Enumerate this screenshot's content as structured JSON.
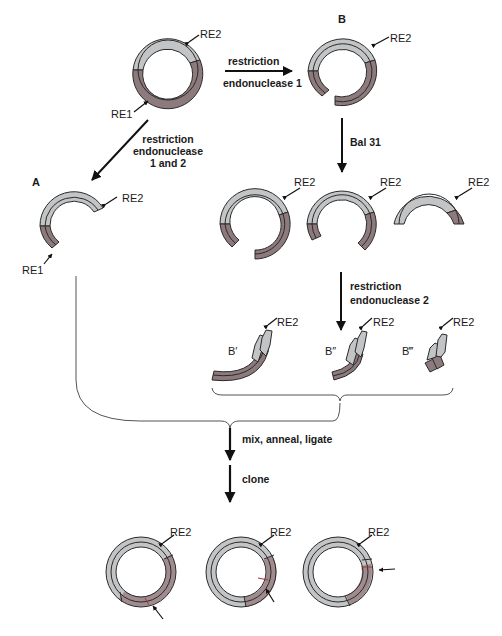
{
  "figure": {
    "colors": {
      "light_strand": "#c2c4c6",
      "dark_strand": "#8d7a7c",
      "outline": "#2a2a2a",
      "arrow": "#111111",
      "bracket": "#555555",
      "junction_red": "#a0343a"
    },
    "top": {
      "plasmid_labels": {
        "re1": "RE1",
        "re2": "RE2"
      },
      "step_to_b": {
        "line1": "restriction",
        "line2": "endonuclease 1"
      },
      "step_to_a": {
        "line1": "restriction",
        "line2": "endonuclease",
        "line3": "1 and 2"
      },
      "b_label": "B",
      "b_re2": "RE2"
    },
    "path_a": {
      "label": "A",
      "re2": "RE2",
      "re1": "RE1"
    },
    "path_b": {
      "bal31_label": "Bal 31",
      "deletions": [
        {
          "re2": "RE2"
        },
        {
          "re2": "RE2"
        },
        {
          "re2": "RE2"
        }
      ],
      "step_re2": {
        "line1": "restriction",
        "line2": "endonuclease 2"
      },
      "fragments": [
        {
          "label": "B′",
          "re2": "RE2"
        },
        {
          "label": "B″",
          "re2": "RE2"
        },
        {
          "label": "B‴",
          "re2": "RE2"
        }
      ]
    },
    "merge": {
      "step1": "mix, anneal, ligate",
      "step2": "clone"
    },
    "products": [
      {
        "re2": "RE2"
      },
      {
        "re2": "RE2"
      },
      {
        "re2": "RE2"
      }
    ]
  }
}
